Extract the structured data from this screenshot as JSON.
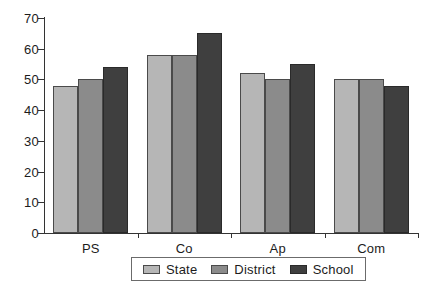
{
  "chart_data": {
    "type": "bar",
    "title": "",
    "subtitle": "",
    "xlabel": "",
    "ylabel": "",
    "categories": [
      "PS",
      "Co",
      "Ap",
      "Com"
    ],
    "series": [
      {
        "name": "State",
        "color": "#b6b6b6",
        "values": [
          48,
          58,
          52,
          50
        ]
      },
      {
        "name": "District",
        "color": "#8b8b8b",
        "values": [
          50,
          58,
          50,
          50
        ]
      },
      {
        "name": "School",
        "color": "#3f3f3f",
        "values": [
          54,
          65,
          55,
          48
        ]
      }
    ],
    "ylim": [
      0,
      70
    ],
    "ytick_labels": [
      "0",
      "10",
      "20",
      "30",
      "40",
      "50",
      "60",
      "70"
    ],
    "ytick_values": [
      0,
      10,
      20,
      30,
      40,
      50,
      60,
      70
    ],
    "grid": false,
    "legend_position": "bottom",
    "axis_color": "#333333",
    "background": "#ffffff"
  }
}
